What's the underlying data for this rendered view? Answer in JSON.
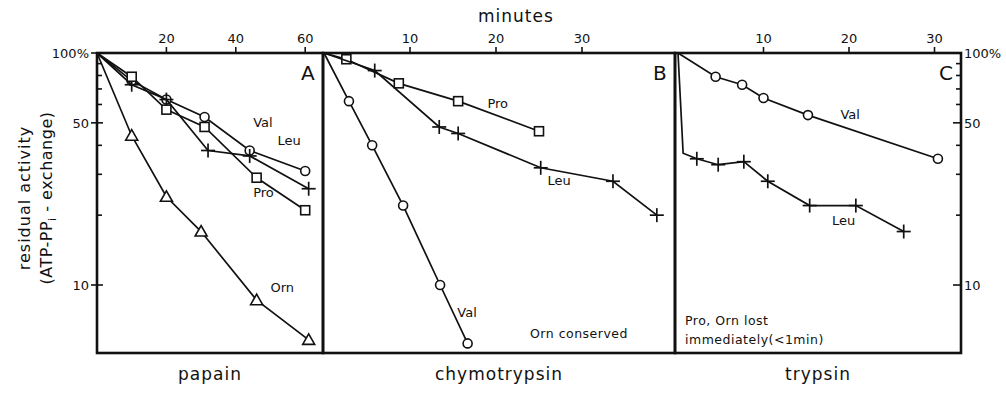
{
  "figure": {
    "top_axis_title": "minutes",
    "y_axis_title_line1": "residual activity",
    "y_axis_title_line2": "(ATP-PP",
    "y_axis_title_sub": "i",
    "y_axis_title_line2_end": " - exchange)"
  },
  "chart_data": [
    {
      "type": "line",
      "panel": "A",
      "title": "papain",
      "xlabel": "minutes",
      "ylabel": "residual activity (ATP-PPi-exchange)",
      "yscale": "log",
      "xlim": [
        0,
        65
      ],
      "ylim": [
        5.1,
        100
      ],
      "x_ticks": [
        20,
        40,
        60
      ],
      "y_ticks": [
        {
          "value": 100,
          "label": "100%"
        },
        {
          "value": 50,
          "label": "50"
        },
        {
          "value": 10,
          "label": "10"
        }
      ],
      "series": [
        {
          "name": "Val",
          "marker": "circle",
          "x": [
            0,
            10,
            20,
            31,
            44,
            60
          ],
          "y": [
            100,
            76,
            63,
            53,
            38,
            31
          ],
          "label_pos": [
            45,
            48
          ]
        },
        {
          "name": "Leu",
          "marker": "plus",
          "x": [
            0,
            10,
            20,
            32,
            44,
            61
          ],
          "y": [
            100,
            73,
            63,
            38,
            36,
            26
          ],
          "label_pos": [
            52,
            40
          ]
        },
        {
          "name": "Pro",
          "marker": "square",
          "x": [
            0,
            10,
            20,
            31,
            46,
            60
          ],
          "y": [
            100,
            79,
            57,
            48,
            29,
            21
          ],
          "label_pos": [
            45,
            24
          ]
        },
        {
          "name": "Orn",
          "marker": "triangle",
          "x": [
            0,
            10,
            20,
            30,
            46,
            61
          ],
          "y": [
            100,
            44,
            24,
            17,
            8.6,
            5.8
          ],
          "label_pos": [
            50,
            9.3
          ]
        }
      ],
      "annotations": []
    },
    {
      "type": "line",
      "panel": "B",
      "title": "chymotrypsin",
      "xlabel": "minutes",
      "yscale": "log",
      "xlim": [
        0,
        41
      ],
      "ylim": [
        5.1,
        100
      ],
      "x_ticks": [
        10,
        20,
        30
      ],
      "series": [
        {
          "name": "Pro",
          "marker": "square",
          "x": [
            0,
            2.6,
            8.7,
            15.6,
            25
          ],
          "y": [
            100,
            94,
            74,
            62,
            46
          ],
          "label_pos": [
            19,
            58
          ]
        },
        {
          "name": "Leu",
          "marker": "plus",
          "x": [
            0,
            5.9,
            13.4,
            15.6,
            25.2,
            33.6,
            38.7
          ],
          "y": [
            100,
            84,
            48,
            45,
            32,
            28,
            20
          ],
          "label_pos": [
            26,
            27
          ]
        },
        {
          "name": "Val",
          "marker": "circle",
          "x": [
            0,
            2.9,
            5.6,
            9.2,
            13.5,
            16.7
          ],
          "y": [
            100,
            62,
            40,
            22,
            10,
            5.6
          ],
          "label_pos": [
            15.5,
            7.3
          ]
        }
      ],
      "annotations": [
        "Orn conserved"
      ]
    },
    {
      "type": "line",
      "panel": "C",
      "title": "trypsin",
      "xlabel": "minutes",
      "yscale": "log",
      "xlim": [
        0,
        33
      ],
      "ylim": [
        5.1,
        100
      ],
      "x_ticks": [
        10,
        20,
        30
      ],
      "y_ticks_right": [
        {
          "value": 100,
          "label": "100%"
        },
        {
          "value": 50,
          "label": "50"
        },
        {
          "value": 10,
          "label": "10"
        }
      ],
      "series": [
        {
          "name": "Val",
          "marker": "circle",
          "x": [
            0,
            4.4,
            7.5,
            10,
            15.2,
            30.4
          ],
          "y": [
            100,
            79,
            73,
            64,
            54,
            35
          ],
          "label_pos": [
            19,
            52
          ]
        },
        {
          "name": "Leu",
          "marker": "plus",
          "x": [
            0,
            0.6,
            2.2,
            4.7,
            7.7,
            10.5,
            15.4,
            20.8,
            26.4
          ],
          "y": [
            100,
            37,
            35,
            33,
            34,
            28,
            22,
            22,
            17
          ],
          "label_pos": [
            18,
            18.2
          ]
        }
      ],
      "annotations": [
        "Pro, Orn lost",
        "immediately(<1min)"
      ]
    }
  ]
}
